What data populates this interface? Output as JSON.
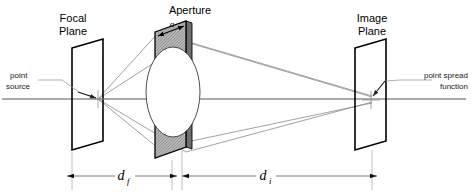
{
  "figure": {
    "background_color": "#ffffff",
    "line_color": "#000000",
    "ray_color": "#8a8a8a",
    "aperture_fill": "#a8a8a8"
  },
  "labels": {
    "focal_plane_line1": "Focal",
    "focal_plane_line2": "Plane",
    "aperture": "Aperture",
    "aperture_diameter": "a",
    "image_plane_line1": "Image",
    "image_plane_line2": "Plane",
    "point_source_line1": "point",
    "point_source_line2": "source",
    "psf_line1": "point spread",
    "psf_line2": "function"
  },
  "dimensions": [
    {
      "name": "object-distance",
      "symbol": "d",
      "subscript": "f",
      "description": "distance from focal plane to aperture"
    },
    {
      "name": "image-distance",
      "symbol": "d",
      "subscript": "i",
      "description": "distance from aperture to image plane"
    }
  ],
  "elements": [
    {
      "name": "focal-plane",
      "shape": "parallelogram"
    },
    {
      "name": "aperture-plate",
      "shape": "parallelogram-with-elliptical-hole"
    },
    {
      "name": "image-plane",
      "shape": "parallelogram"
    },
    {
      "name": "optical-axis",
      "shape": "horizontal-line"
    }
  ]
}
